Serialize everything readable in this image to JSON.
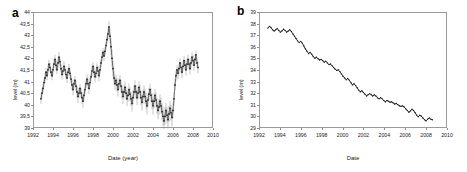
{
  "figure": {
    "panel_a_letter": "a",
    "panel_b_letter": "b"
  },
  "chart_data": [
    {
      "panel": "a",
      "type": "scatter",
      "title": "",
      "xlabel": "Date (year)",
      "ylabel": "level (m)",
      "xlim": [
        1992,
        2010
      ],
      "ylim": [
        39,
        44
      ],
      "xticks": [
        "1992",
        "1994",
        "1996",
        "1998",
        "2000",
        "2002",
        "2004",
        "2006",
        "2008",
        "2010"
      ],
      "ytick_values": [
        39,
        39.5,
        40,
        40.5,
        41,
        41.5,
        42,
        42.5,
        43,
        43.5,
        44
      ],
      "yticks": [
        "39",
        "39,5",
        "40",
        "40,5",
        "41",
        "41,5",
        "42",
        "42,5",
        "43",
        "43,5",
        "44"
      ],
      "grid": false,
      "legend": "none",
      "marker_color": "#1a1a1a",
      "errorbar_color": "#8a8a8a",
      "has_errorbars": true,
      "x": [
        1992.7,
        1992.8,
        1992.9,
        1993.0,
        1993.1,
        1993.2,
        1993.3,
        1993.4,
        1993.5,
        1993.6,
        1993.7,
        1993.8,
        1993.9,
        1994.0,
        1994.1,
        1994.2,
        1994.3,
        1994.4,
        1994.5,
        1994.6,
        1994.7,
        1994.8,
        1994.9,
        1995.0,
        1995.1,
        1995.2,
        1995.3,
        1995.4,
        1995.5,
        1995.6,
        1995.7,
        1995.8,
        1995.9,
        1996.0,
        1996.1,
        1996.2,
        1996.3,
        1996.4,
        1996.5,
        1996.6,
        1996.7,
        1996.8,
        1996.9,
        1997.0,
        1997.1,
        1997.2,
        1997.3,
        1997.4,
        1997.5,
        1997.6,
        1997.7,
        1997.8,
        1997.9,
        1998.0,
        1998.1,
        1998.2,
        1998.3,
        1998.4,
        1998.5,
        1998.6,
        1998.7,
        1998.8,
        1998.9,
        1999.0,
        1999.1,
        1999.2,
        1999.3,
        1999.4,
        1999.5,
        1999.6,
        1999.7,
        1999.8,
        1999.9,
        2000.0,
        2000.1,
        2000.2,
        2000.3,
        2000.4,
        2000.5,
        2000.6,
        2000.7,
        2000.8,
        2000.9,
        2001.0,
        2001.1,
        2001.2,
        2001.3,
        2001.4,
        2001.5,
        2001.6,
        2001.7,
        2001.8,
        2001.9,
        2002.0,
        2002.1,
        2002.2,
        2002.3,
        2002.4,
        2002.5,
        2002.6,
        2002.7,
        2002.8,
        2002.9,
        2003.0,
        2003.1,
        2003.2,
        2003.3,
        2003.4,
        2003.5,
        2003.6,
        2003.7,
        2003.8,
        2003.9,
        2004.0,
        2004.1,
        2004.2,
        2004.3,
        2004.4,
        2004.5,
        2004.6,
        2004.7,
        2004.8,
        2004.9,
        2005.0,
        2005.1,
        2005.2,
        2005.3,
        2005.4,
        2005.5,
        2005.6,
        2005.7,
        2005.8,
        2005.9,
        2006.0,
        2006.1,
        2006.2,
        2006.3,
        2006.4,
        2006.5,
        2006.6,
        2006.7,
        2006.8,
        2006.9,
        2007.0,
        2007.1,
        2007.2,
        2007.3,
        2007.4,
        2007.5,
        2007.6,
        2007.7,
        2007.8,
        2007.9,
        2008.0,
        2008.1,
        2008.2,
        2008.3,
        2008.4
      ],
      "y": [
        40.3,
        40.55,
        40.75,
        41.0,
        41.2,
        41.45,
        41.3,
        41.55,
        41.8,
        41.65,
        41.45,
        41.3,
        41.55,
        41.8,
        42.0,
        41.75,
        41.55,
        41.85,
        42.1,
        41.9,
        41.6,
        41.35,
        41.5,
        41.7,
        41.55,
        41.35,
        41.2,
        41.45,
        41.6,
        41.4,
        41.15,
        40.9,
        40.7,
        40.95,
        41.1,
        40.85,
        40.6,
        40.4,
        40.55,
        40.75,
        40.55,
        40.35,
        40.2,
        40.45,
        40.7,
        40.95,
        41.15,
        40.95,
        40.75,
        41.0,
        41.25,
        41.5,
        41.7,
        41.45,
        41.25,
        41.4,
        41.65,
        41.5,
        41.3,
        41.55,
        41.85,
        42.1,
        42.3,
        42.15,
        42.35,
        42.6,
        42.85,
        43.1,
        43.4,
        43.0,
        42.55,
        42.05,
        41.6,
        41.2,
        40.95,
        41.1,
        40.9,
        40.7,
        40.95,
        41.1,
        40.85,
        40.6,
        40.4,
        40.6,
        40.8,
        40.55,
        40.3,
        40.45,
        40.7,
        40.5,
        40.3,
        40.1,
        40.35,
        40.6,
        40.85,
        40.6,
        40.35,
        40.55,
        40.8,
        40.6,
        40.35,
        40.15,
        40.4,
        40.6,
        40.4,
        40.2,
        40.0,
        40.25,
        40.5,
        40.7,
        40.45,
        40.2,
        40.0,
        40.2,
        40.45,
        40.25,
        40.0,
        39.8,
        39.95,
        40.2,
        40.0,
        39.75,
        39.55,
        39.35,
        39.55,
        39.8,
        39.6,
        39.4,
        39.65,
        39.9,
        39.7,
        39.5,
        39.8,
        40.3,
        40.9,
        41.3,
        41.55,
        41.4,
        41.6,
        41.85,
        41.65,
        41.45,
        41.7,
        41.95,
        41.75,
        41.55,
        41.8,
        42.0,
        41.8,
        41.6,
        41.85,
        42.1,
        41.95,
        41.75,
        42.0,
        42.2,
        41.85,
        41.65
      ],
      "yerr": [
        0.22,
        0.2,
        0.18,
        0.2,
        0.22,
        0.18,
        0.2,
        0.22,
        0.18,
        0.2,
        0.18,
        0.2,
        0.22,
        0.18,
        0.2,
        0.22,
        0.18,
        0.2,
        0.22,
        0.18,
        0.2,
        0.22,
        0.18,
        0.2,
        0.18,
        0.2,
        0.22,
        0.18,
        0.2,
        0.22,
        0.2,
        0.22,
        0.25,
        0.2,
        0.18,
        0.22,
        0.25,
        0.28,
        0.22,
        0.2,
        0.22,
        0.25,
        0.28,
        0.22,
        0.2,
        0.18,
        0.2,
        0.22,
        0.25,
        0.2,
        0.18,
        0.2,
        0.18,
        0.22,
        0.25,
        0.2,
        0.18,
        0.22,
        0.25,
        0.2,
        0.18,
        0.2,
        0.18,
        0.22,
        0.18,
        0.18,
        0.2,
        0.22,
        0.25,
        0.3,
        0.35,
        0.38,
        0.35,
        0.3,
        0.28,
        0.25,
        0.28,
        0.3,
        0.25,
        0.22,
        0.28,
        0.3,
        0.32,
        0.28,
        0.25,
        0.3,
        0.32,
        0.28,
        0.25,
        0.3,
        0.32,
        0.35,
        0.3,
        0.28,
        0.25,
        0.3,
        0.32,
        0.28,
        0.25,
        0.3,
        0.32,
        0.35,
        0.3,
        0.28,
        0.32,
        0.35,
        0.38,
        0.32,
        0.28,
        0.25,
        0.3,
        0.35,
        0.38,
        0.32,
        0.28,
        0.32,
        0.35,
        0.38,
        0.35,
        0.3,
        0.35,
        0.38,
        0.4,
        0.42,
        0.38,
        0.32,
        0.35,
        0.38,
        0.35,
        0.3,
        0.35,
        0.38,
        0.35,
        0.3,
        0.25,
        0.22,
        0.2,
        0.25,
        0.22,
        0.2,
        0.22,
        0.25,
        0.22,
        0.2,
        0.22,
        0.25,
        0.22,
        0.2,
        0.22,
        0.25,
        0.22,
        0.2,
        0.22,
        0.25,
        0.2,
        0.18,
        0.22,
        0.25
      ]
    },
    {
      "panel": "b",
      "type": "line",
      "title": "",
      "xlabel": "Date",
      "ylabel": "level (m)",
      "xlim": [
        1992,
        2010
      ],
      "ylim": [
        29,
        39
      ],
      "xticks": [
        "1992",
        "1994",
        "1996",
        "1998",
        "2000",
        "2002",
        "2004",
        "2006",
        "2008",
        "2010"
      ],
      "ytick_values": [
        29,
        30,
        31,
        32,
        33,
        34,
        35,
        36,
        37,
        38,
        39
      ],
      "yticks": [
        "29",
        "30",
        "31",
        "32",
        "33",
        "34",
        "35",
        "36",
        "37",
        "38",
        "39"
      ],
      "grid": false,
      "legend": "none",
      "line_color": "#1a1a1a",
      "has_errorbars": false,
      "x": [
        1992.75,
        1992.9,
        1993.05,
        1993.2,
        1993.35,
        1993.5,
        1993.65,
        1993.8,
        1993.95,
        1994.1,
        1994.25,
        1994.4,
        1994.55,
        1994.7,
        1994.85,
        1995.0,
        1995.15,
        1995.3,
        1995.45,
        1995.6,
        1995.75,
        1995.9,
        1996.05,
        1996.2,
        1996.35,
        1996.5,
        1996.65,
        1996.8,
        1996.95,
        1997.1,
        1997.25,
        1997.4,
        1997.55,
        1997.7,
        1997.85,
        1998.0,
        1998.15,
        1998.3,
        1998.45,
        1998.6,
        1998.75,
        1998.9,
        1999.05,
        1999.2,
        1999.35,
        1999.5,
        1999.65,
        1999.8,
        1999.95,
        2000.1,
        2000.25,
        2000.4,
        2000.55,
        2000.7,
        2000.85,
        2001.0,
        2001.15,
        2001.3,
        2001.45,
        2001.6,
        2001.75,
        2001.9,
        2002.05,
        2002.2,
        2002.35,
        2002.5,
        2002.65,
        2002.8,
        2002.95,
        2003.1,
        2003.25,
        2003.4,
        2003.55,
        2003.7,
        2003.85,
        2004.0,
        2004.15,
        2004.3,
        2004.45,
        2004.6,
        2004.75,
        2004.9,
        2005.05,
        2005.2,
        2005.35,
        2005.5,
        2005.65,
        2005.8,
        2005.95,
        2006.1,
        2006.25,
        2006.4,
        2006.55,
        2006.7,
        2006.85,
        2007.0,
        2007.15,
        2007.3,
        2007.45,
        2007.6,
        2007.75,
        2007.9,
        2008.05,
        2008.2,
        2008.35,
        2008.5
      ],
      "y": [
        37.7,
        37.85,
        37.75,
        37.55,
        37.45,
        37.55,
        37.65,
        37.5,
        37.35,
        37.45,
        37.6,
        37.5,
        37.35,
        37.45,
        37.55,
        37.4,
        37.2,
        37.0,
        36.8,
        36.6,
        36.45,
        36.55,
        36.4,
        36.15,
        35.9,
        35.7,
        35.5,
        35.6,
        35.45,
        35.25,
        35.1,
        35.2,
        35.05,
        34.95,
        35.0,
        34.9,
        34.75,
        34.85,
        34.7,
        34.55,
        34.6,
        34.45,
        34.3,
        34.15,
        34.05,
        34.1,
        33.95,
        33.75,
        33.55,
        33.4,
        33.25,
        33.35,
        33.2,
        33.0,
        32.8,
        32.9,
        32.75,
        32.55,
        32.35,
        32.2,
        32.3,
        32.15,
        32.0,
        31.85,
        31.95,
        32.05,
        31.95,
        31.85,
        31.95,
        31.85,
        31.7,
        31.6,
        31.7,
        31.6,
        31.45,
        31.35,
        31.45,
        31.4,
        31.3,
        31.35,
        31.25,
        31.15,
        31.2,
        31.1,
        31.0,
        30.95,
        31.0,
        30.9,
        30.75,
        30.6,
        30.45,
        30.55,
        30.7,
        30.6,
        30.4,
        30.2,
        30.05,
        30.2,
        30.1,
        29.95,
        29.8,
        29.7,
        29.85,
        29.95,
        29.85,
        29.8
      ]
    }
  ]
}
